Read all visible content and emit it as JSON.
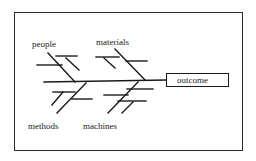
{
  "diagram": {
    "type": "fishbone",
    "outcome": "outcome",
    "categories": {
      "top_left": "people",
      "top_right": "materials",
      "bottom_left": "methods",
      "bottom_right": "machines"
    },
    "colors": {
      "line": "#1a1a1a",
      "background": "#ffffff"
    }
  }
}
